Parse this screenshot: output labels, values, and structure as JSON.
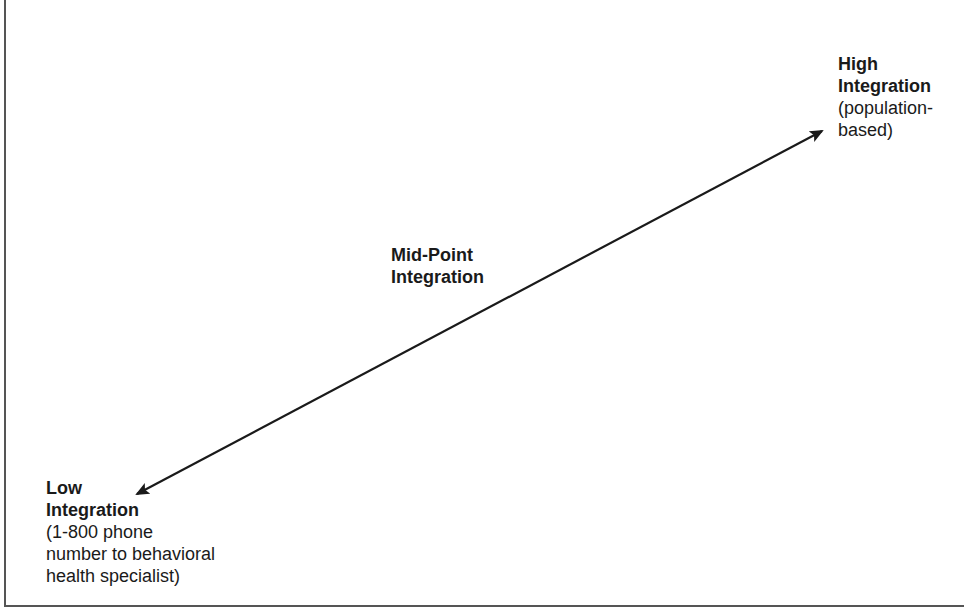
{
  "diagram": {
    "type": "continuum",
    "arrow": {
      "direction": "bidirectional",
      "start": {
        "x": 137,
        "y": 494
      },
      "end": {
        "x": 822,
        "y": 131
      },
      "color": "#1a1a1a"
    },
    "nodes": [
      {
        "id": "low",
        "title_line1": "Low",
        "title_line2": "Integration",
        "desc_line1": "(1-800 phone",
        "desc_line2": "number to behavioral",
        "desc_line3": "health specialist)"
      },
      {
        "id": "mid",
        "title_line1": "Mid-Point",
        "title_line2": "Integration"
      },
      {
        "id": "high",
        "title_line1": "High",
        "title_line2": "Integration",
        "desc_line1": "(population-",
        "desc_line2": "based)"
      }
    ]
  },
  "colors": {
    "frame": "#555555",
    "text": "#1a1a1a",
    "background": "#ffffff"
  }
}
